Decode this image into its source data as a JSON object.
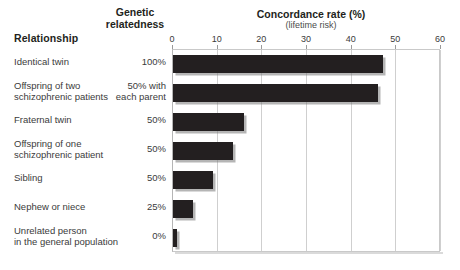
{
  "headers": {
    "relationship": "Relationship",
    "genetic_relatedness_line1": "Genetic",
    "genetic_relatedness_line2": "relatedness"
  },
  "chart_data": {
    "type": "bar",
    "orientation": "horizontal",
    "title": "Concordance rate (%)",
    "subtitle": "(lifetime risk)",
    "xlabel": "Concordance rate (%)",
    "ylabel": "Relationship",
    "xlim": [
      0,
      60
    ],
    "xticks": [
      0,
      10,
      20,
      30,
      40,
      50,
      60
    ],
    "xtick_labels": [
      "0",
      "10",
      "20",
      "30",
      "40",
      "50",
      "60"
    ],
    "grid": true,
    "legend": "none",
    "bar_color": "#231f20",
    "categories": [
      "Identical twin",
      "Offspring of two schizophrenic patients",
      "Fraternal twin",
      "Offspring of one schizophrenic patient",
      "Sibling",
      "Nephew or niece",
      "Unrelated person in the general population"
    ],
    "values": [
      47,
      46,
      16,
      13.5,
      9,
      4.5,
      1
    ],
    "relatedness": [
      "100%",
      "50% with each parent",
      "50%",
      "50%",
      "50%",
      "25%",
      "0%"
    ],
    "rows": [
      {
        "label_line1": "Identical twin",
        "label_line2": "",
        "relatedness_line1": "100%",
        "relatedness_line2": "",
        "value": 47
      },
      {
        "label_line1": "Offspring of two",
        "label_line2": "schizophrenic patients",
        "relatedness_line1": "50% with",
        "relatedness_line2": "each parent",
        "value": 46
      },
      {
        "label_line1": "Fraternal twin",
        "label_line2": "",
        "relatedness_line1": "50%",
        "relatedness_line2": "",
        "value": 16
      },
      {
        "label_line1": "Offspring of one",
        "label_line2": "schizophrenic patient",
        "relatedness_line1": "50%",
        "relatedness_line2": "",
        "value": 13.5
      },
      {
        "label_line1": "Sibling",
        "label_line2": "",
        "relatedness_line1": "50%",
        "relatedness_line2": "",
        "value": 9
      },
      {
        "label_line1": "Nephew or niece",
        "label_line2": "",
        "relatedness_line1": "25%",
        "relatedness_line2": "",
        "value": 4.5
      },
      {
        "label_line1": "Unrelated person",
        "label_line2": "in the general population",
        "relatedness_line1": "0%",
        "relatedness_line2": "",
        "value": 1
      }
    ]
  }
}
